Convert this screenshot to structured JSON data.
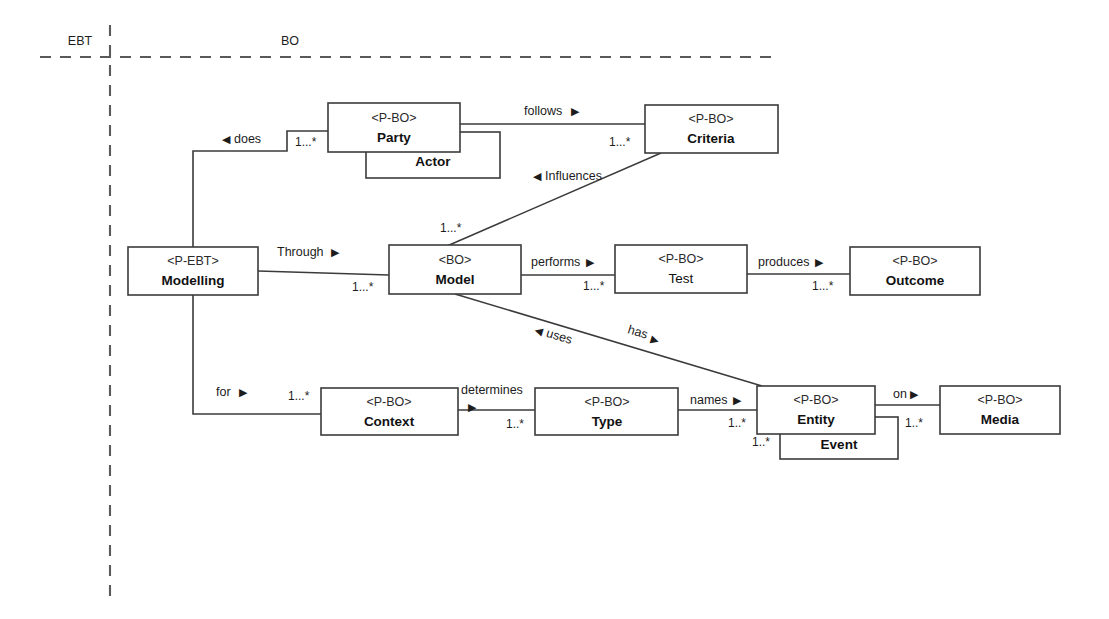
{
  "diagram": {
    "zones": [
      {
        "id": "ebt",
        "label": "EBT"
      },
      {
        "id": "bo",
        "label": "BO"
      }
    ],
    "colors": {
      "background": "#ffffff",
      "stroke": "#3b3b3b",
      "text": "#1c1c1c",
      "divider": "#5a5a5a"
    },
    "boxes": [
      {
        "id": "modelling",
        "stereotype": "<P-EBT>",
        "name": "Modelling",
        "bold": true,
        "x": 128,
        "y": 247,
        "w": 130,
        "h": 48
      },
      {
        "id": "party",
        "stereotype": "<P-BO>",
        "name": "Party",
        "bold": true,
        "x": 328,
        "y": 103,
        "w": 132,
        "h": 49
      },
      {
        "id": "actor",
        "stereotype": "",
        "name": "Actor",
        "bold": true,
        "x": 366,
        "y": 132,
        "w": 134,
        "h": 46
      },
      {
        "id": "criteria",
        "stereotype": "<P-BO>",
        "name": "Criteria",
        "bold": true,
        "x": 645,
        "y": 105,
        "w": 133,
        "h": 48
      },
      {
        "id": "model",
        "stereotype": "<BO>",
        "name": "Model",
        "bold": true,
        "x": 389,
        "y": 245,
        "w": 132,
        "h": 49
      },
      {
        "id": "test",
        "stereotype": "<P-BO>",
        "name": "Test",
        "bold": false,
        "x": 615,
        "y": 245,
        "w": 132,
        "h": 48
      },
      {
        "id": "outcome",
        "stereotype": "<P-BO>",
        "name": "Outcome",
        "bold": true,
        "x": 850,
        "y": 247,
        "w": 130,
        "h": 48
      },
      {
        "id": "context",
        "stereotype": "<P-BO>",
        "name": "Context",
        "bold": true,
        "x": 321,
        "y": 388,
        "w": 137,
        "h": 47
      },
      {
        "id": "type",
        "stereotype": "<P-BO>",
        "name": "Type",
        "bold": true,
        "x": 535,
        "y": 388,
        "w": 143,
        "h": 47
      },
      {
        "id": "entity",
        "stereotype": "<P-BO>",
        "name": "Entity",
        "bold": true,
        "x": 757,
        "y": 386,
        "w": 118,
        "h": 48
      },
      {
        "id": "event",
        "stereotype": "",
        "name": "Event",
        "bold": true,
        "x": 780,
        "y": 417,
        "w": 118,
        "h": 42
      },
      {
        "id": "media",
        "stereotype": "<P-BO>",
        "name": "Media",
        "bold": true,
        "x": 940,
        "y": 386,
        "w": 120,
        "h": 48
      }
    ],
    "associations": [
      {
        "id": "does",
        "label": "does",
        "arrow": "left",
        "from": "modelling",
        "to": "party"
      },
      {
        "id": "follows",
        "label": "follows",
        "arrow": "right",
        "from": "party",
        "to": "criteria"
      },
      {
        "id": "influences",
        "label": "Influences",
        "arrow": "left",
        "from": "criteria",
        "to": "model"
      },
      {
        "id": "through",
        "label": "Through",
        "arrow": "right",
        "from": "modelling",
        "to": "model"
      },
      {
        "id": "performs",
        "label": "performs",
        "arrow": "right",
        "from": "model",
        "to": "test"
      },
      {
        "id": "produces",
        "label": "produces",
        "arrow": "right",
        "from": "test",
        "to": "outcome"
      },
      {
        "id": "for",
        "label": "for",
        "arrow": "right",
        "from": "modelling",
        "to": "context"
      },
      {
        "id": "determines",
        "label": "determines",
        "arrow": "right",
        "from": "context",
        "to": "type"
      },
      {
        "id": "names",
        "label": "names",
        "arrow": "right",
        "from": "type",
        "to": "entity"
      },
      {
        "id": "on",
        "label": "on",
        "arrow": "right",
        "from": "entity",
        "to": "media"
      },
      {
        "id": "uses",
        "label": "uses",
        "arrow": "left",
        "from": "model",
        "to": "entity"
      },
      {
        "id": "has",
        "label": "has",
        "arrow": "right",
        "from": "model",
        "to": "entity"
      }
    ],
    "multiplicities": [
      {
        "id": "m-party",
        "value": "1...*"
      },
      {
        "id": "m-criteria",
        "value": "1...*"
      },
      {
        "id": "m-model-top",
        "value": "1...*"
      },
      {
        "id": "m-model-left",
        "value": "1...*"
      },
      {
        "id": "m-test",
        "value": "1...*"
      },
      {
        "id": "m-outcome",
        "value": "1...*"
      },
      {
        "id": "m-context",
        "value": "1...*"
      },
      {
        "id": "m-type",
        "value": "1..*"
      },
      {
        "id": "m-entity",
        "value": "1..*"
      },
      {
        "id": "m-event",
        "value": "1..*"
      },
      {
        "id": "m-media",
        "value": "1..*"
      }
    ]
  }
}
